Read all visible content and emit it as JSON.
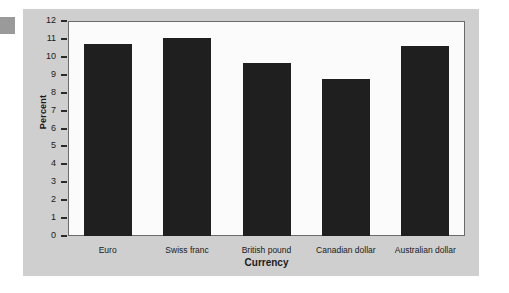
{
  "chart_data": {
    "type": "bar",
    "title": "",
    "xlabel": "Currency",
    "ylabel": "Percent",
    "categories": [
      "Euro",
      "Swiss franc",
      "British pound",
      "Canadian dollar",
      "Australian dollar"
    ],
    "values": [
      10.7,
      11.05,
      9.65,
      8.75,
      10.6
    ],
    "ylim": [
      0,
      12
    ],
    "ytick_labels": [
      "12",
      "11",
      "10",
      "9",
      "8",
      "7",
      "6",
      "5",
      "4",
      "3",
      "2",
      "1",
      "0"
    ],
    "ytick_values": [
      12,
      11,
      10,
      9,
      8,
      7,
      6,
      5,
      4,
      3,
      2,
      1,
      0
    ],
    "grid": false,
    "legend": "none",
    "bar_color": "#1f1f1f",
    "panel_color": "#cfcfcf",
    "plot_background": "#fbfbfb",
    "axis_color": "#6b6b6b"
  }
}
